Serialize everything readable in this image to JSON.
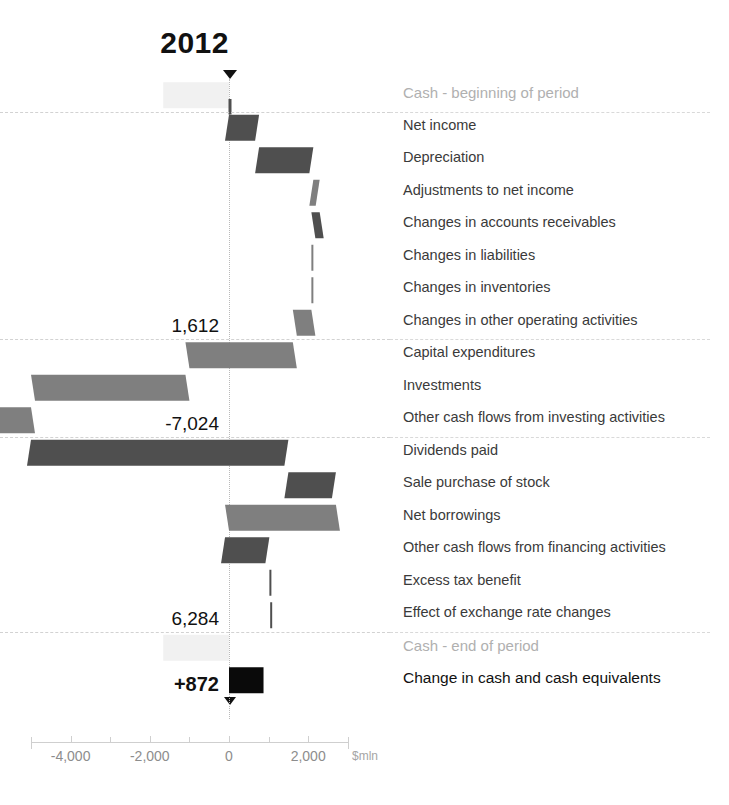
{
  "title": "2012",
  "axis": {
    "unit": "$mln",
    "ticks": [
      {
        "value": -4000,
        "label": "-4,000"
      },
      {
        "value": -2000,
        "label": "-2,000"
      },
      {
        "value": 0,
        "label": "0"
      },
      {
        "value": 2000,
        "label": "2,000"
      }
    ],
    "min": -5000,
    "max": 3000
  },
  "subtotals": [
    {
      "key": "operating",
      "label": "1,612"
    },
    {
      "key": "investing",
      "label": "-7,024"
    },
    {
      "key": "financing",
      "label": "6,284"
    },
    {
      "key": "change",
      "label": "+872"
    }
  ],
  "chart_data": {
    "type": "bar",
    "chart_style": "waterfall-horizontal",
    "title": "2012",
    "xlabel": "$mln",
    "ylabel": "",
    "xlim": [
      -5000,
      3000
    ],
    "grid": false,
    "legend": "none",
    "categories": [
      "Cash - beginning of period",
      "Net income",
      "Depreciation",
      "Adjustments to net income",
      "Changes in accounts receivables",
      "Changes in liabilities",
      "Changes in inventories",
      "Changes in other operating activities",
      "Capital expenditures",
      "Investments",
      "Other cash flows from investing activities",
      "Dividends paid",
      "Sale purchase of stock",
      "Net borrowings",
      "Other cash flows from financing activities",
      "Excess tax benefit",
      "Effect of exchange rate changes",
      "Cash - end of period",
      "Change in cash and cash equivalents"
    ],
    "rows": [
      {
        "label": "Cash - beginning of period",
        "kind": "anchor",
        "start": -1660,
        "end": 0,
        "tone": "faint",
        "group": "header"
      },
      {
        "label": "Net income",
        "kind": "delta",
        "start": 0,
        "end": 760,
        "tone": "dark",
        "group": "operating"
      },
      {
        "label": "Depreciation",
        "kind": "delta",
        "start": 760,
        "end": 2130,
        "tone": "dark",
        "group": "operating"
      },
      {
        "label": "Adjustments to net income",
        "kind": "delta",
        "start": 2130,
        "end": 2290,
        "tone": "mid",
        "group": "operating"
      },
      {
        "label": "Changes in accounts receivables",
        "kind": "delta",
        "start": 2290,
        "end": 2080,
        "tone": "dark",
        "group": "operating"
      },
      {
        "label": "Changes in liabilities",
        "kind": "delta",
        "start": 2080,
        "end": 2090,
        "tone": "mid",
        "group": "operating"
      },
      {
        "label": "Changes in inventories",
        "kind": "delta",
        "start": 2090,
        "end": 2080,
        "tone": "mid",
        "group": "operating"
      },
      {
        "label": "Changes in other operating activities",
        "kind": "delta",
        "start": 2080,
        "end": 1612,
        "tone": "mid",
        "group": "operating"
      },
      {
        "label": "Capital expenditures",
        "kind": "delta",
        "start": 1612,
        "end": -1100,
        "tone": "mid",
        "group": "investing"
      },
      {
        "label": "Investments",
        "kind": "delta",
        "start": -1100,
        "end": -5000,
        "tone": "mid",
        "group": "investing"
      },
      {
        "label": "Other cash flows from investing activities",
        "kind": "delta",
        "start": -5000,
        "end": -7024,
        "tone": "mid",
        "group": "investing"
      },
      {
        "label": "Dividends paid",
        "kind": "delta",
        "start": -5000,
        "end": 1500,
        "tone": "dark",
        "group": "financing"
      },
      {
        "label": "Sale purchase of stock",
        "kind": "delta",
        "start": 1500,
        "end": 2700,
        "tone": "dark",
        "group": "financing"
      },
      {
        "label": "Net borrowings",
        "kind": "delta",
        "start": 2700,
        "end": -100,
        "tone": "mid",
        "group": "financing"
      },
      {
        "label": "Other cash flows from financing activities",
        "kind": "delta",
        "start": -100,
        "end": 1020,
        "tone": "dark",
        "group": "financing"
      },
      {
        "label": "Excess tax benefit",
        "kind": "delta",
        "start": 1020,
        "end": 1040,
        "tone": "dark",
        "group": "financing"
      },
      {
        "label": "Effect of exchange rate changes",
        "kind": "delta",
        "start": 1040,
        "end": 1050,
        "tone": "dark",
        "group": "financing"
      },
      {
        "label": "Cash - end of period",
        "kind": "anchor",
        "start": -1660,
        "end": 0,
        "tone": "faint",
        "group": "footer"
      },
      {
        "label": "Change in cash and cash equivalents",
        "kind": "total",
        "start": 0,
        "end": 872,
        "tone": "black",
        "group": "footer"
      }
    ],
    "subtotal_markers": [
      {
        "after_row": 7,
        "value": 1612,
        "label": "1,612"
      },
      {
        "after_row": 10,
        "value": -7024,
        "label": "-7,024"
      },
      {
        "after_row": 16,
        "value": 6284,
        "label": "6,284"
      },
      {
        "after_row": 18,
        "value": 872,
        "label": "+872"
      }
    ],
    "colors": {
      "dark": "#4f4f4f",
      "mid": "#7f7f7f",
      "faint": "#f1f1f1",
      "black": "#0a0a0a",
      "axis": "#8d8d8d",
      "label": "#3a3a3a",
      "muted": "#b0b0b0"
    }
  }
}
